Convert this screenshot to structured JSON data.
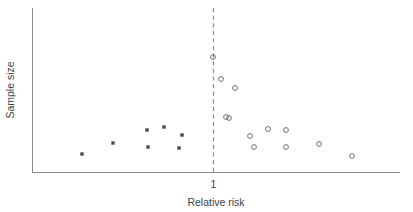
{
  "chart_data": {
    "type": "scatter",
    "title": "",
    "xlabel": "Relative risk",
    "ylabel": "Sample size",
    "xtick_labels": [
      "1"
    ],
    "ytick_labels": [],
    "grid": false,
    "legend": null,
    "annotations": [
      {
        "name": "null-effect-reference-line",
        "kind": "vertical-dashed-line",
        "x": 1,
        "label": "1"
      }
    ],
    "axis_ranges": {
      "x_axis_pixel_span": [
        32,
        400
      ],
      "y_axis_pixel_span": [
        8,
        172
      ],
      "x_reference_value": 1
    },
    "series": [
      {
        "name": "Published / included studies",
        "marker": "filled-square",
        "marker_color": "#4a4a4a",
        "points": [
          {
            "x": 0.4,
            "y": 0.11,
            "px": 82,
            "py": 154
          },
          {
            "x": 0.53,
            "y": 0.18,
            "px": 113,
            "py": 143
          },
          {
            "x": 0.67,
            "y": 0.26,
            "px": 147,
            "py": 130
          },
          {
            "x": 0.67,
            "y": 0.15,
            "px": 148,
            "py": 147
          },
          {
            "x": 0.73,
            "y": 0.28,
            "px": 164,
            "py": 127
          },
          {
            "x": 0.81,
            "y": 0.23,
            "px": 182,
            "py": 135
          },
          {
            "x": 0.8,
            "y": 0.15,
            "px": 179,
            "py": 148
          }
        ]
      },
      {
        "name": "Unpublished / smaller studies",
        "marker": "open-circle",
        "marker_color": "#6e6e6e",
        "points": [
          {
            "x": 1.0,
            "y": 0.7,
            "px": 213,
            "py": 57
          },
          {
            "x": 1.04,
            "y": 0.57,
            "px": 221,
            "py": 79
          },
          {
            "x": 1.1,
            "y": 0.51,
            "px": 235,
            "py": 88
          },
          {
            "x": 1.07,
            "y": 0.34,
            "px": 226,
            "py": 117
          },
          {
            "x": 1.08,
            "y": 0.33,
            "px": 229,
            "py": 118
          },
          {
            "x": 1.17,
            "y": 0.22,
            "px": 250,
            "py": 136
          },
          {
            "x": 1.19,
            "y": 0.15,
            "px": 254,
            "py": 147
          },
          {
            "x": 1.26,
            "y": 0.26,
            "px": 268,
            "py": 129
          },
          {
            "x": 1.34,
            "y": 0.26,
            "px": 286,
            "py": 130
          },
          {
            "x": 1.34,
            "y": 0.15,
            "px": 286,
            "py": 147
          },
          {
            "x": 1.48,
            "y": 0.17,
            "px": 319,
            "py": 144
          },
          {
            "x": 1.62,
            "y": 0.1,
            "px": 352,
            "py": 156
          }
        ]
      }
    ]
  },
  "axes": {
    "x_label": "Relative risk",
    "y_label": "Sample size",
    "x_tick_one": "1"
  },
  "colors": {
    "axis": "#8a8a8a",
    "reference_line": "#8d8d8d",
    "filled_marker": "#4a4a4a",
    "open_marker": "#6e6e6e",
    "text": "#3f3f3f",
    "background": "#ffffff"
  }
}
